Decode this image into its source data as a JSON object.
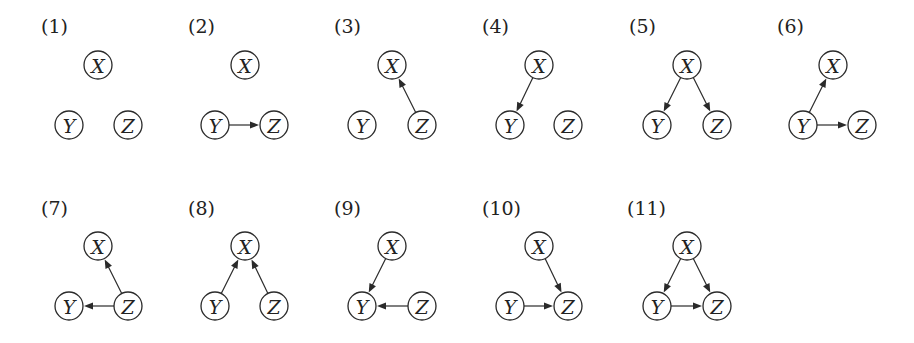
{
  "figure": {
    "node_radius": 14,
    "colors": {
      "stroke": "#2a2a2a",
      "text": "#222222",
      "background": "#ffffff"
    },
    "panels": [
      {
        "id": 1,
        "label": "(1)",
        "label_pos": [
          41,
          33
        ],
        "nodes": {
          "X": [
            98,
            65
          ],
          "Y": [
            69,
            125
          ],
          "Z": [
            128,
            125
          ]
        },
        "edges": []
      },
      {
        "id": 2,
        "label": "(2)",
        "label_pos": [
          188,
          33
        ],
        "nodes": {
          "X": [
            245,
            65
          ],
          "Y": [
            215,
            125
          ],
          "Z": [
            274,
            125
          ]
        },
        "edges": [
          [
            "Y",
            "Z"
          ]
        ]
      },
      {
        "id": 3,
        "label": "(3)",
        "label_pos": [
          334,
          33
        ],
        "nodes": {
          "X": [
            392,
            65
          ],
          "Y": [
            362,
            125
          ],
          "Z": [
            422,
            125
          ]
        },
        "edges": [
          [
            "Z",
            "X"
          ]
        ]
      },
      {
        "id": 4,
        "label": "(4)",
        "label_pos": [
          482,
          33
        ],
        "nodes": {
          "X": [
            539,
            65
          ],
          "Y": [
            510,
            125
          ],
          "Z": [
            568,
            125
          ]
        },
        "edges": [
          [
            "X",
            "Y"
          ]
        ]
      },
      {
        "id": 5,
        "label": "(5)",
        "label_pos": [
          629,
          33
        ],
        "nodes": {
          "X": [
            687,
            65
          ],
          "Y": [
            657,
            125
          ],
          "Z": [
            717,
            125
          ]
        },
        "edges": [
          [
            "X",
            "Y"
          ],
          [
            "X",
            "Z"
          ]
        ]
      },
      {
        "id": 6,
        "label": "(6)",
        "label_pos": [
          777,
          33
        ],
        "nodes": {
          "X": [
            833,
            65
          ],
          "Y": [
            803,
            125
          ],
          "Z": [
            862,
            125
          ]
        },
        "edges": [
          [
            "Y",
            "X"
          ],
          [
            "Y",
            "Z"
          ]
        ]
      },
      {
        "id": 7,
        "label": "(7)",
        "label_pos": [
          41,
          215
        ],
        "nodes": {
          "X": [
            98,
            246
          ],
          "Y": [
            69,
            306
          ],
          "Z": [
            128,
            306
          ]
        },
        "edges": [
          [
            "Z",
            "X"
          ],
          [
            "Z",
            "Y"
          ]
        ]
      },
      {
        "id": 8,
        "label": "(8)",
        "label_pos": [
          188,
          215
        ],
        "nodes": {
          "X": [
            245,
            246
          ],
          "Y": [
            215,
            306
          ],
          "Z": [
            274,
            306
          ]
        },
        "edges": [
          [
            "Y",
            "X"
          ],
          [
            "Z",
            "X"
          ]
        ]
      },
      {
        "id": 9,
        "label": "(9)",
        "label_pos": [
          334,
          215
        ],
        "nodes": {
          "X": [
            392,
            246
          ],
          "Y": [
            362,
            306
          ],
          "Z": [
            422,
            306
          ]
        },
        "edges": [
          [
            "X",
            "Y"
          ],
          [
            "Z",
            "Y"
          ]
        ]
      },
      {
        "id": 10,
        "label": "(10)",
        "label_pos": [
          482,
          215
        ],
        "nodes": {
          "X": [
            539,
            246
          ],
          "Y": [
            510,
            306
          ],
          "Z": [
            568,
            306
          ]
        },
        "edges": [
          [
            "X",
            "Z"
          ],
          [
            "Y",
            "Z"
          ]
        ]
      },
      {
        "id": 11,
        "label": "(11)",
        "label_pos": [
          627,
          215
        ],
        "nodes": {
          "X": [
            687,
            246
          ],
          "Y": [
            657,
            306
          ],
          "Z": [
            717,
            306
          ]
        },
        "edges": [
          [
            "X",
            "Y"
          ],
          [
            "X",
            "Z"
          ],
          [
            "Y",
            "Z"
          ]
        ]
      }
    ]
  }
}
